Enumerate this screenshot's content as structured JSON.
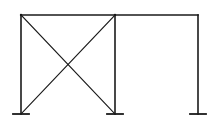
{
  "diagram": {
    "type": "structural-frame",
    "stroke_color": "#1a1a1a",
    "background": "#ffffff",
    "beam": {
      "x1": 21,
      "x2": 198,
      "y": 15
    },
    "columns": [
      {
        "id": "left",
        "x": 21,
        "y_top": 15,
        "y_base": 114
      },
      {
        "id": "middle",
        "x": 115,
        "y_top": 15,
        "y_base": 114
      },
      {
        "id": "right",
        "x": 198,
        "y_top": 15,
        "y_base": 114
      }
    ],
    "bracing": [
      {
        "x1": 21,
        "y1": 15,
        "x2": 115,
        "y2": 114
      },
      {
        "x1": 115,
        "y1": 15,
        "x2": 21,
        "y2": 114
      }
    ],
    "supports": [
      {
        "x": 21,
        "y": 114,
        "half_width": 8
      },
      {
        "x": 115,
        "y": 114,
        "half_width": 8
      },
      {
        "x": 198,
        "y": 114,
        "half_width": 8
      }
    ]
  }
}
